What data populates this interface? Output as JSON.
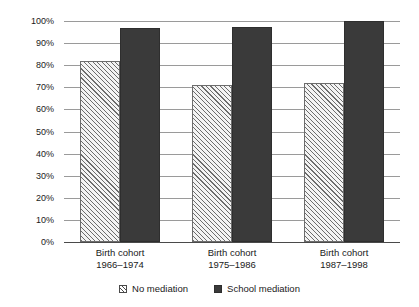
{
  "chart_data": {
    "type": "bar",
    "title": "",
    "subtitle": "",
    "xlabel": "",
    "ylabel": "",
    "ylim": [
      0,
      100
    ],
    "ytick_labels": [
      "100%",
      "90%",
      "80%",
      "70%",
      "60%",
      "50%",
      "40%",
      "30%",
      "20%",
      "10%",
      "0%"
    ],
    "ytick_values": [
      100,
      90,
      80,
      70,
      60,
      50,
      40,
      30,
      20,
      10,
      0
    ],
    "grid": true,
    "legend_position": "bottom",
    "categories": [
      "Birth cohort\n1966–1974",
      "Birth cohort\n1975–1986",
      "Birth cohort\n1987–1998"
    ],
    "category_lines": [
      [
        "Birth cohort",
        "1966–1974"
      ],
      [
        "Birth cohort",
        "1975–1986"
      ],
      [
        "Birth cohort",
        "1987–1998"
      ]
    ],
    "series": [
      {
        "name": "No mediation",
        "color": "#f4f4f4",
        "pattern": "diagonal-hatch",
        "values": [
          82,
          71,
          72
        ]
      },
      {
        "name": "School mediation",
        "color": "#3a3a3a",
        "pattern": "solid",
        "values": [
          97,
          97.5,
          100
        ]
      }
    ],
    "annotations": []
  },
  "legend": {
    "items": [
      {
        "label": "No mediation",
        "swatch": "hatched-square-icon"
      },
      {
        "label": "School mediation",
        "swatch": "filled-square-icon"
      }
    ]
  },
  "colors": {
    "gridline": "#9a9a9a",
    "axis": "#4a4a4a",
    "bar_no_mediation": "#f4f4f4",
    "bar_school_mediation": "#3a3a3a",
    "text": "#1a1a1a",
    "background": "#ffffff"
  }
}
